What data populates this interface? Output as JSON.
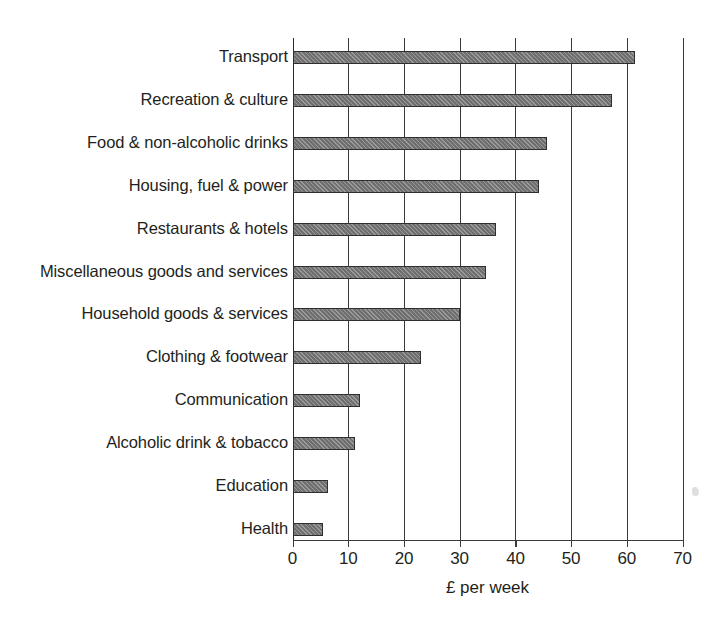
{
  "chart_data": {
    "type": "bar",
    "orientation": "horizontal",
    "title": "",
    "xlabel": "£ per week",
    "ylabel": "",
    "xlim": [
      0,
      70
    ],
    "xticks": [
      0,
      10,
      20,
      30,
      40,
      50,
      60,
      70
    ],
    "xtick_labels": [
      "0",
      "10",
      "20",
      "30",
      "40",
      "50",
      "60",
      "70"
    ],
    "grid": "vertical",
    "legend": "none",
    "bar_color": "#6f6f6f",
    "bar_edge_color": "#2f2f2f",
    "bar_fill_pattern": "hatched",
    "categories": [
      "Transport",
      "Recreation & culture",
      "Food & non-alcoholic drinks",
      "Housing, fuel & power",
      "Restaurants & hotels",
      "Miscellaneous goods and services",
      "Household goods & services",
      "Clothing & footwear",
      "Communication",
      "Alcoholic drink & tobacco",
      "Education",
      "Health"
    ],
    "values": [
      61.5,
      57.3,
      45.6,
      44.3,
      36.6,
      34.8,
      30.0,
      23.1,
      12.1,
      11.2,
      6.3,
      5.4
    ]
  }
}
